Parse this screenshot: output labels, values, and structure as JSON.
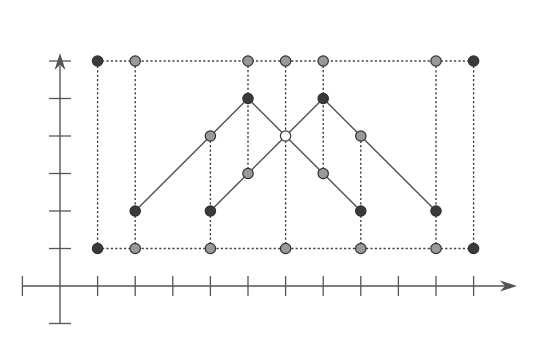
{
  "diagram": {
    "origin_px": [
      60,
      286
    ],
    "unit_px": [
      37.6,
      37.5
    ],
    "x_ticks": [
      -1,
      1,
      2,
      3,
      4,
      5,
      6,
      7,
      8,
      9,
      10,
      11
    ],
    "y_ticks": [
      -1,
      1,
      2,
      3,
      4,
      5,
      6
    ],
    "colors": {
      "axis": "#555555",
      "dotted": "#444444",
      "path": "#555555",
      "dark_point": "#3a3a3a",
      "gray_point": "#999999",
      "hollow_point": "#ffffff",
      "point_stroke": "#333333"
    },
    "dotted_lines": {
      "horizontal": [
        {
          "y": 6,
          "x1": 1,
          "x2": 11
        },
        {
          "y": 1,
          "x1": 1,
          "x2": 11
        }
      ],
      "vertical": [
        {
          "x": 1,
          "y1": 1,
          "y2": 6
        },
        {
          "x": 2,
          "y1": 1,
          "y2": 6
        },
        {
          "x": 4,
          "y1": 1,
          "y2": 4
        },
        {
          "x": 5,
          "y1": 3,
          "y2": 6
        },
        {
          "x": 6,
          "y1": 1,
          "y2": 6
        },
        {
          "x": 7,
          "y1": 3,
          "y2": 6
        },
        {
          "x": 8,
          "y1": 1,
          "y2": 4
        },
        {
          "x": 10,
          "y1": 1,
          "y2": 6
        },
        {
          "x": 11,
          "y1": 1,
          "y2": 6
        }
      ]
    },
    "paths": [
      {
        "name": "path-a",
        "points": [
          [
            2,
            2
          ],
          [
            4,
            4
          ],
          [
            5,
            5
          ],
          [
            6,
            4
          ],
          [
            7,
            3
          ],
          [
            8,
            2
          ]
        ]
      },
      {
        "name": "path-b",
        "points": [
          [
            4,
            2
          ],
          [
            5,
            3
          ],
          [
            6,
            4
          ],
          [
            7,
            5
          ],
          [
            8,
            4
          ],
          [
            10,
            2
          ]
        ]
      }
    ],
    "points": [
      {
        "x": 1,
        "y": 6,
        "style": "dark"
      },
      {
        "x": 2,
        "y": 6,
        "style": "gray"
      },
      {
        "x": 5,
        "y": 6,
        "style": "gray"
      },
      {
        "x": 6,
        "y": 6,
        "style": "gray"
      },
      {
        "x": 7,
        "y": 6,
        "style": "gray"
      },
      {
        "x": 10,
        "y": 6,
        "style": "gray"
      },
      {
        "x": 11,
        "y": 6,
        "style": "dark"
      },
      {
        "x": 5,
        "y": 5,
        "style": "dark"
      },
      {
        "x": 7,
        "y": 5,
        "style": "dark"
      },
      {
        "x": 4,
        "y": 4,
        "style": "gray"
      },
      {
        "x": 6,
        "y": 4,
        "style": "hollow"
      },
      {
        "x": 8,
        "y": 4,
        "style": "gray"
      },
      {
        "x": 5,
        "y": 3,
        "style": "gray"
      },
      {
        "x": 7,
        "y": 3,
        "style": "gray"
      },
      {
        "x": 2,
        "y": 2,
        "style": "dark"
      },
      {
        "x": 4,
        "y": 2,
        "style": "dark"
      },
      {
        "x": 8,
        "y": 2,
        "style": "dark"
      },
      {
        "x": 10,
        "y": 2,
        "style": "dark"
      },
      {
        "x": 1,
        "y": 1,
        "style": "dark"
      },
      {
        "x": 2,
        "y": 1,
        "style": "gray"
      },
      {
        "x": 4,
        "y": 1,
        "style": "gray"
      },
      {
        "x": 6,
        "y": 1,
        "style": "gray"
      },
      {
        "x": 8,
        "y": 1,
        "style": "gray"
      },
      {
        "x": 10,
        "y": 1,
        "style": "gray"
      },
      {
        "x": 11,
        "y": 1,
        "style": "dark"
      }
    ]
  }
}
